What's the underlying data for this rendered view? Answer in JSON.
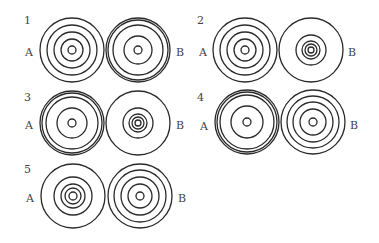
{
  "diagram": {
    "stroke_color": "#2a2a2a",
    "panels": [
      {
        "number": "1",
        "label_pos": [
          24,
          24
        ],
        "A": {
          "label": "A",
          "label_pos": [
            25,
            56
          ],
          "center": [
            72,
            50
          ],
          "radii": [
            32,
            25,
            18,
            11,
            4
          ]
        },
        "B": {
          "label": "B",
          "label_pos": [
            176,
            56
          ],
          "center": [
            138,
            50
          ],
          "radii": [
            32,
            30,
            25,
            14,
            4
          ]
        }
      },
      {
        "number": "2",
        "label_pos": [
          197,
          24
        ],
        "A": {
          "label": "A",
          "label_pos": [
            199,
            56
          ],
          "center": [
            245,
            50
          ],
          "radii": [
            32,
            25,
            18,
            11,
            4
          ]
        },
        "B": {
          "label": "B",
          "label_pos": [
            348,
            56
          ],
          "center": [
            311,
            50
          ],
          "radii": [
            32,
            15,
            9,
            6,
            3
          ]
        }
      },
      {
        "number": "3",
        "label_pos": [
          24,
          101
        ],
        "A": {
          "label": "A",
          "label_pos": [
            25,
            129
          ],
          "center": [
            72,
            123
          ],
          "radii": [
            32,
            30,
            26,
            15,
            4
          ]
        },
        "B": {
          "label": "B",
          "label_pos": [
            176,
            129
          ],
          "center": [
            138,
            123
          ],
          "radii": [
            32,
            15,
            9,
            6,
            3
          ]
        }
      },
      {
        "number": "4",
        "label_pos": [
          197,
          101
        ],
        "A": {
          "label": "A",
          "label_pos": [
            200,
            130
          ],
          "center": [
            247,
            122
          ],
          "radii": [
            32,
            30,
            27,
            16,
            4
          ]
        },
        "B": {
          "label": "B",
          "label_pos": [
            350,
            129
          ],
          "center": [
            313,
            122
          ],
          "radii": [
            32,
            26,
            20,
            13,
            4
          ]
        }
      },
      {
        "number": "5",
        "label_pos": [
          24,
          173
        ],
        "A": {
          "label": "A",
          "label_pos": [
            26,
            202
          ],
          "center": [
            73,
            196
          ],
          "radii": [
            32,
            19,
            12,
            8,
            4
          ]
        },
        "B": {
          "label": "B",
          "label_pos": [
            178,
            202
          ],
          "center": [
            140,
            196
          ],
          "radii": [
            32,
            26,
            19,
            12,
            4
          ]
        }
      }
    ]
  }
}
